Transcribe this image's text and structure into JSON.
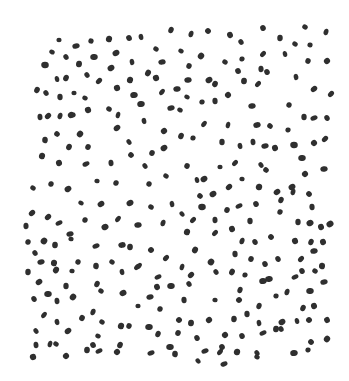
{
  "image": {
    "description": "Hand-drawn stippling pattern of small dark ink dots scattered randomly over a white paper background",
    "background_color": "#ffffff",
    "dot_color": "#2f2f2f",
    "width": 349,
    "height": 381
  },
  "dots": [
    [
      59,
      40
    ],
    [
      76,
      46
    ],
    [
      91,
      41
    ],
    [
      109,
      39
    ],
    [
      129,
      38
    ],
    [
      141,
      37
    ],
    [
      171,
      30
    ],
    [
      52,
      52
    ],
    [
      66,
      57
    ],
    [
      79,
      64
    ],
    [
      94,
      57
    ],
    [
      116,
      53
    ],
    [
      156,
      49
    ],
    [
      45,
      65
    ],
    [
      111,
      68
    ],
    [
      132,
      62
    ],
    [
      162,
      62
    ],
    [
      57,
      79
    ],
    [
      66,
      78
    ],
    [
      87,
      75
    ],
    [
      99,
      81
    ],
    [
      130,
      80
    ],
    [
      148,
      73
    ],
    [
      156,
      78
    ],
    [
      37,
      90
    ],
    [
      46,
      93
    ],
    [
      60,
      97
    ],
    [
      74,
      93
    ],
    [
      85,
      98
    ],
    [
      117,
      88
    ],
    [
      134,
      95
    ],
    [
      162,
      92
    ],
    [
      71,
      115
    ],
    [
      88,
      110
    ],
    [
      109,
      109
    ],
    [
      118,
      115
    ],
    [
      141,
      104
    ],
    [
      171,
      108
    ],
    [
      40,
      117
    ],
    [
      48,
      116
    ],
    [
      60,
      116
    ],
    [
      72,
      115
    ],
    [
      144,
      121
    ],
    [
      57,
      134
    ],
    [
      80,
      134
    ],
    [
      117,
      128
    ],
    [
      164,
      131
    ],
    [
      45,
      140
    ],
    [
      69,
      147
    ],
    [
      88,
      147
    ],
    [
      129,
      142
    ],
    [
      152,
      153
    ],
    [
      164,
      148
    ],
    [
      42,
      156
    ],
    [
      59,
      163
    ],
    [
      86,
      164
    ],
    [
      111,
      163
    ],
    [
      131,
      155
    ],
    [
      145,
      166
    ],
    [
      166,
      176
    ],
    [
      33,
      188
    ],
    [
      51,
      184
    ],
    [
      68,
      189
    ],
    [
      97,
      181
    ],
    [
      116,
      183
    ],
    [
      149,
      184
    ],
    [
      191,
      34
    ],
    [
      208,
      31
    ],
    [
      230,
      35
    ],
    [
      241,
      42
    ],
    [
      263,
      28
    ],
    [
      280,
      38
    ],
    [
      295,
      44
    ],
    [
      310,
      45
    ],
    [
      305,
      27
    ],
    [
      326,
      32
    ],
    [
      181,
      51
    ],
    [
      201,
      56
    ],
    [
      225,
      62
    ],
    [
      242,
      59
    ],
    [
      263,
      54
    ],
    [
      285,
      54
    ],
    [
      308,
      61
    ],
    [
      327,
      61
    ],
    [
      189,
      66
    ],
    [
      238,
      71
    ],
    [
      261,
      69
    ],
    [
      267,
      72
    ],
    [
      296,
      77
    ],
    [
      188,
      80
    ],
    [
      209,
      80
    ],
    [
      215,
      84
    ],
    [
      244,
      81
    ],
    [
      258,
      84
    ],
    [
      314,
      89
    ],
    [
      331,
      94
    ],
    [
      177,
      89
    ],
    [
      187,
      97
    ],
    [
      202,
      102
    ],
    [
      215,
      101
    ],
    [
      228,
      95
    ],
    [
      252,
      106
    ],
    [
      289,
      105
    ],
    [
      180,
      110
    ],
    [
      304,
      117
    ],
    [
      314,
      118
    ],
    [
      327,
      118
    ],
    [
      228,
      125
    ],
    [
      204,
      124
    ],
    [
      257,
      125
    ],
    [
      270,
      126
    ],
    [
      181,
      136
    ],
    [
      193,
      138
    ],
    [
      288,
      130
    ],
    [
      222,
      142
    ],
    [
      240,
      146
    ],
    [
      253,
      142
    ],
    [
      265,
      146
    ],
    [
      275,
      148
    ],
    [
      294,
      145
    ],
    [
      314,
      143
    ],
    [
      325,
      139
    ],
    [
      302,
      158
    ],
    [
      187,
      166
    ],
    [
      220,
      167
    ],
    [
      235,
      163
    ],
    [
      261,
      165
    ],
    [
      266,
      170
    ],
    [
      324,
      169
    ],
    [
      305,
      174
    ],
    [
      197,
      180
    ],
    [
      204,
      179
    ],
    [
      229,
      187
    ],
    [
      242,
      179
    ],
    [
      259,
      187
    ],
    [
      292,
      187
    ],
    [
      81,
      203
    ],
    [
      101,
      204
    ],
    [
      130,
      203
    ],
    [
      151,
      207
    ],
    [
      172,
      204
    ],
    [
      32,
      213
    ],
    [
      48,
      217
    ],
    [
      59,
      223
    ],
    [
      85,
      220
    ],
    [
      118,
      219
    ],
    [
      105,
      227
    ],
    [
      138,
      225
    ],
    [
      163,
      223
    ],
    [
      26,
      226
    ],
    [
      70,
      234
    ],
    [
      71,
      239
    ],
    [
      28,
      242
    ],
    [
      44,
      241
    ],
    [
      55,
      245
    ],
    [
      96,
      246
    ],
    [
      122,
      245
    ],
    [
      130,
      247
    ],
    [
      151,
      250
    ],
    [
      35,
      253
    ],
    [
      41,
      262
    ],
    [
      54,
      263
    ],
    [
      78,
      262
    ],
    [
      96,
      266
    ],
    [
      112,
      262
    ],
    [
      122,
      272
    ],
    [
      137,
      267
    ],
    [
      166,
      258
    ],
    [
      28,
      272
    ],
    [
      56,
      270
    ],
    [
      72,
      271
    ],
    [
      139,
      266
    ],
    [
      158,
      277
    ],
    [
      39,
      282
    ],
    [
      66,
      286
    ],
    [
      97,
      284
    ],
    [
      101,
      291
    ],
    [
      157,
      287
    ],
    [
      171,
      286
    ],
    [
      34,
      299
    ],
    [
      48,
      294
    ],
    [
      57,
      301
    ],
    [
      73,
      297
    ],
    [
      123,
      293
    ],
    [
      138,
      306
    ],
    [
      160,
      309
    ],
    [
      150,
      297
    ],
    [
      44,
      315
    ],
    [
      57,
      322
    ],
    [
      82,
      318
    ],
    [
      93,
      312
    ],
    [
      102,
      322
    ],
    [
      121,
      326
    ],
    [
      129,
      326
    ],
    [
      149,
      327
    ],
    [
      158,
      334
    ],
    [
      36,
      331
    ],
    [
      68,
      331
    ],
    [
      98,
      336
    ],
    [
      36,
      345
    ],
    [
      50,
      344
    ],
    [
      56,
      344
    ],
    [
      87,
      350
    ],
    [
      93,
      345
    ],
    [
      99,
      351
    ],
    [
      120,
      345
    ],
    [
      117,
      352
    ],
    [
      151,
      353
    ],
    [
      170,
      347
    ],
    [
      33,
      357
    ],
    [
      66,
      356
    ],
    [
      200,
      196
    ],
    [
      213,
      194
    ],
    [
      277,
      192
    ],
    [
      293,
      192
    ],
    [
      309,
      194
    ],
    [
      202,
      207
    ],
    [
      227,
      210
    ],
    [
      239,
      206
    ],
    [
      256,
      204
    ],
    [
      281,
      200
    ],
    [
      312,
      207
    ],
    [
      182,
      214
    ],
    [
      193,
      220
    ],
    [
      215,
      220
    ],
    [
      250,
      221
    ],
    [
      280,
      212
    ],
    [
      298,
      222
    ],
    [
      310,
      223
    ],
    [
      321,
      227
    ],
    [
      330,
      224
    ],
    [
      187,
      232
    ],
    [
      215,
      233
    ],
    [
      232,
      229
    ],
    [
      255,
      242
    ],
    [
      242,
      241
    ],
    [
      271,
      237
    ],
    [
      295,
      241
    ],
    [
      311,
      242
    ],
    [
      323,
      242
    ],
    [
      195,
      250
    ],
    [
      211,
      262
    ],
    [
      235,
      254
    ],
    [
      251,
      259
    ],
    [
      265,
      264
    ],
    [
      278,
      259
    ],
    [
      301,
      259
    ],
    [
      314,
      251
    ],
    [
      322,
      266
    ],
    [
      182,
      267
    ],
    [
      191,
      275
    ],
    [
      216,
      272
    ],
    [
      232,
      272
    ],
    [
      245,
      275
    ],
    [
      263,
      281
    ],
    [
      269,
      279
    ],
    [
      295,
      277
    ],
    [
      302,
      271
    ],
    [
      315,
      271
    ],
    [
      189,
      284
    ],
    [
      240,
      290
    ],
    [
      276,
      296
    ],
    [
      287,
      292
    ],
    [
      310,
      291
    ],
    [
      324,
      282
    ],
    [
      184,
      300
    ],
    [
      215,
      300
    ],
    [
      239,
      300
    ],
    [
      259,
      306
    ],
    [
      303,
      308
    ],
    [
      314,
      306
    ],
    [
      179,
      320
    ],
    [
      191,
      323
    ],
    [
      209,
      320
    ],
    [
      234,
      319
    ],
    [
      247,
      314
    ],
    [
      259,
      323
    ],
    [
      282,
      322
    ],
    [
      297,
      321
    ],
    [
      309,
      320
    ],
    [
      327,
      320
    ],
    [
      178,
      333
    ],
    [
      197,
      338
    ],
    [
      225,
      335
    ],
    [
      242,
      336
    ],
    [
      263,
      333
    ],
    [
      276,
      329
    ],
    [
      281,
      329
    ],
    [
      311,
      342
    ],
    [
      222,
      347
    ],
    [
      327,
      339
    ],
    [
      175,
      354
    ],
    [
      205,
      351
    ],
    [
      220,
      352
    ],
    [
      237,
      352
    ],
    [
      257,
      353
    ],
    [
      294,
      353
    ],
    [
      308,
      350
    ],
    [
      198,
      361
    ],
    [
      224,
      364
    ],
    [
      257,
      357
    ]
  ]
}
